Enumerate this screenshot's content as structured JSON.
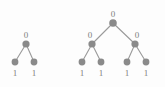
{
  "figure": {
    "background_color": "#fdfdfd",
    "node_color": "#8a8a8a",
    "edge_color": "#9a9a9a",
    "label_color": "#7d7d7d",
    "width": 165,
    "height": 87
  },
  "chart_data": {
    "type": "diagram",
    "diagram_kind": "binary-tree",
    "title": "",
    "trees": [
      {
        "name": "left-tree",
        "depth": 2,
        "node_count": 3,
        "leaf_count": 2,
        "nodes": [
          {
            "id": "L-root",
            "label": "0",
            "level": 0,
            "x": 26,
            "y": 44,
            "r": 3.6,
            "label_x": 26,
            "label_y": 31,
            "label_pos": "above"
          },
          {
            "id": "L-leaf-1",
            "label": "1",
            "level": 1,
            "x": 15,
            "y": 62,
            "r": 3.4,
            "label_x": 15,
            "label_y": 69,
            "label_pos": "below"
          },
          {
            "id": "L-leaf-2",
            "label": "1",
            "level": 1,
            "x": 34,
            "y": 62,
            "r": 3.4,
            "label_x": 34,
            "label_y": 69,
            "label_pos": "below"
          }
        ],
        "edges": [
          {
            "from": "L-root",
            "to": "L-leaf-1"
          },
          {
            "from": "L-root",
            "to": "L-leaf-2"
          }
        ]
      },
      {
        "name": "right-tree",
        "depth": 3,
        "node_count": 7,
        "leaf_count": 4,
        "nodes": [
          {
            "id": "R-root",
            "label": "0",
            "level": 0,
            "x": 113,
            "y": 23,
            "r": 3.8,
            "label_x": 113,
            "label_y": 10,
            "label_pos": "above"
          },
          {
            "id": "R-mid-L",
            "label": "0",
            "level": 1,
            "x": 92,
            "y": 44,
            "r": 3.6,
            "label_x": 90,
            "label_y": 31,
            "label_pos": "above"
          },
          {
            "id": "R-mid-R",
            "label": "0",
            "level": 1,
            "x": 135,
            "y": 44,
            "r": 3.6,
            "label_x": 137,
            "label_y": 31,
            "label_pos": "above"
          },
          {
            "id": "R-leaf-1",
            "label": "1",
            "level": 2,
            "x": 82,
            "y": 62,
            "r": 3.4,
            "label_x": 82,
            "label_y": 69,
            "label_pos": "below"
          },
          {
            "id": "R-leaf-2",
            "label": "1",
            "level": 2,
            "x": 101,
            "y": 62,
            "r": 3.4,
            "label_x": 101,
            "label_y": 69,
            "label_pos": "below"
          },
          {
            "id": "R-leaf-3",
            "label": "1",
            "level": 2,
            "x": 127,
            "y": 62,
            "r": 3.4,
            "label_x": 127,
            "label_y": 69,
            "label_pos": "below"
          },
          {
            "id": "R-leaf-4",
            "label": "1",
            "level": 2,
            "x": 146,
            "y": 62,
            "r": 3.4,
            "label_x": 146,
            "label_y": 69,
            "label_pos": "below"
          }
        ],
        "edges": [
          {
            "from": "R-root",
            "to": "R-mid-L"
          },
          {
            "from": "R-root",
            "to": "R-mid-R"
          },
          {
            "from": "R-mid-L",
            "to": "R-leaf-1"
          },
          {
            "from": "R-mid-L",
            "to": "R-leaf-2"
          },
          {
            "from": "R-mid-R",
            "to": "R-leaf-3"
          },
          {
            "from": "R-mid-R",
            "to": "R-leaf-4"
          }
        ]
      }
    ]
  }
}
